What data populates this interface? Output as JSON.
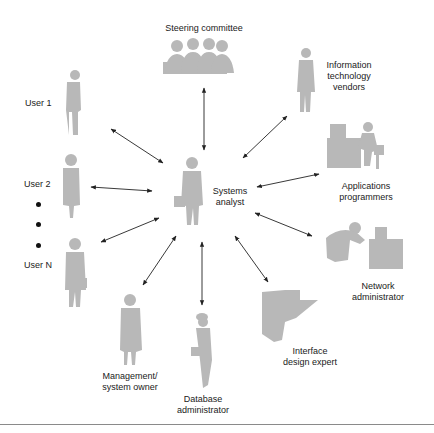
{
  "diagram": {
    "center": {
      "id": "systems-analyst",
      "label": "Systems\nanalyst"
    },
    "nodes": [
      {
        "id": "steering-committee",
        "label": "Steering committee",
        "icon": "group-of-people-icon"
      },
      {
        "id": "it-vendors",
        "label": "Information\ntechnology\nvendors",
        "icon": "standing-man-icon"
      },
      {
        "id": "applications-programmers",
        "label": "Applications\nprogrammers",
        "icon": "person-at-computer-icon"
      },
      {
        "id": "network-administrator",
        "label": "Network\nadministrator",
        "icon": "person-at-workstation-icon"
      },
      {
        "id": "interface-design-expert",
        "label": "Interface\ndesign expert",
        "icon": "person-at-terminal-icon"
      },
      {
        "id": "database-administrator",
        "label": "Database\nadministrator",
        "icon": "woman-with-briefcase-icon"
      },
      {
        "id": "management-system-owner",
        "label": "Management/\nsystem owner",
        "icon": "standing-woman-icon"
      },
      {
        "id": "user-n",
        "label": "User N",
        "icon": "man-with-briefcase-icon"
      },
      {
        "id": "user-2",
        "label": "User 2",
        "icon": "standing-woman-icon"
      },
      {
        "id": "user-1",
        "label": "User 1",
        "icon": "standing-man-icon"
      }
    ],
    "ellipsis_dots": 3,
    "edges": [
      {
        "from": "systems-analyst",
        "to": "steering-committee",
        "type": "bidirectional"
      },
      {
        "from": "systems-analyst",
        "to": "it-vendors",
        "type": "bidirectional"
      },
      {
        "from": "systems-analyst",
        "to": "applications-programmers",
        "type": "bidirectional"
      },
      {
        "from": "systems-analyst",
        "to": "network-administrator",
        "type": "bidirectional"
      },
      {
        "from": "systems-analyst",
        "to": "interface-design-expert",
        "type": "bidirectional"
      },
      {
        "from": "systems-analyst",
        "to": "database-administrator",
        "type": "bidirectional"
      },
      {
        "from": "systems-analyst",
        "to": "management-system-owner",
        "type": "bidirectional"
      },
      {
        "from": "systems-analyst",
        "to": "user-n",
        "type": "bidirectional"
      },
      {
        "from": "systems-analyst",
        "to": "user-2",
        "type": "bidirectional"
      },
      {
        "from": "systems-analyst",
        "to": "user-1",
        "type": "bidirectional"
      }
    ],
    "colors": {
      "figure": "#b8b8b8",
      "arrow": "#222222",
      "text": "#1a1a1a",
      "rule": "#8a8a8a"
    }
  }
}
